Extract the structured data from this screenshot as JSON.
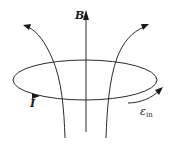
{
  "diagram": {
    "labels": {
      "magnetic_field": "B",
      "current": "I",
      "emf_symbol": "ε",
      "emf_subscript": "in"
    },
    "colors": {
      "line": "#2a2a2a",
      "background": "#ffffff"
    },
    "elements": [
      {
        "type": "ellipse",
        "name": "current-loop",
        "cx": 85,
        "cy": 80,
        "rx": 72,
        "ry": 20
      },
      {
        "type": "arrow",
        "name": "b-axis",
        "from": [
          86,
          132
        ],
        "to": [
          86,
          12
        ]
      },
      {
        "type": "curve-arrow",
        "name": "left-field-line",
        "direction": "up-left"
      },
      {
        "type": "curve-arrow",
        "name": "right-field-line",
        "direction": "up-right"
      },
      {
        "type": "arrowhead",
        "name": "current-direction",
        "direction": "right"
      },
      {
        "type": "curve-arrow",
        "name": "emf-direction",
        "direction": "up-right"
      }
    ]
  }
}
